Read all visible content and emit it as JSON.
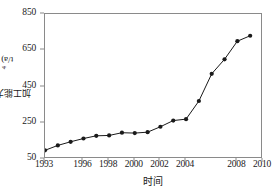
{
  "chart_data": {
    "type": "line",
    "title": "",
    "xlabel": "时间",
    "ylabel": "加工能力(10⁴t/a)",
    "ylabel_base": "加工能力(10",
    "ylabel_exp": "4",
    "ylabel_tail": "t/a)",
    "xlim": [
      1993,
      2010
    ],
    "ylim": [
      50,
      850
    ],
    "grid": false,
    "legend": null,
    "marker": "filled-circle",
    "line_color": "#1a1a1a",
    "marker_color": "#1a1a1a",
    "xticks": [
      1993,
      1996,
      1998,
      2000,
      2002,
      2004,
      2008,
      2010
    ],
    "xtick_labels": [
      "1993",
      "1996",
      "1998",
      "2000",
      "2002",
      "2004",
      "2008",
      "2010"
    ],
    "yticks": [
      50,
      250,
      450,
      650,
      850
    ],
    "ytick_labels": [
      "50",
      "250",
      "450",
      "650",
      "850"
    ],
    "x": [
      1993,
      1994,
      1995,
      1996,
      1997,
      1998,
      1999,
      2000,
      2001,
      2002,
      2003,
      2004,
      2005,
      2006,
      2007,
      2008,
      2009
    ],
    "values": [
      98,
      125,
      145,
      163,
      178,
      180,
      195,
      193,
      198,
      228,
      262,
      270,
      370,
      520,
      600,
      700,
      730
    ],
    "series": [
      {
        "name": "加工能力",
        "x": [
          1993,
          1994,
          1995,
          1996,
          1997,
          1998,
          1999,
          2000,
          2001,
          2002,
          2003,
          2004,
          2005,
          2006,
          2007,
          2008,
          2009
        ],
        "values": [
          98,
          125,
          145,
          163,
          178,
          180,
          195,
          193,
          198,
          228,
          262,
          270,
          370,
          520,
          600,
          700,
          730
        ]
      }
    ]
  },
  "figure": {
    "axis_color": "#8a8a8a",
    "background": "#ffffff"
  }
}
